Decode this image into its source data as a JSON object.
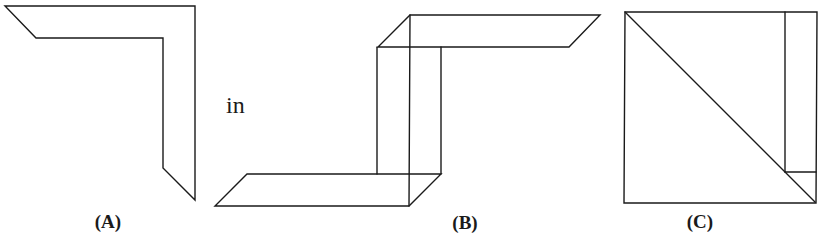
{
  "figure": {
    "stroke_color": "#1a1a1a",
    "background_color": "#ffffff"
  },
  "labels": {
    "a": "(A)",
    "connector": "in",
    "b": "(B)",
    "c": "(C)"
  },
  "panels": [
    {
      "id": "A",
      "content": "L-shaped flat strip outline with slanted ends"
    },
    {
      "id": "B",
      "content": "Folded strip: bottom flat parallelogram, vertical box section, top flat parallelogram"
    },
    {
      "id": "C",
      "content": "Square with main diagonal, vertical strip at right edge, small horizontal segment meeting the diagonal"
    }
  ]
}
